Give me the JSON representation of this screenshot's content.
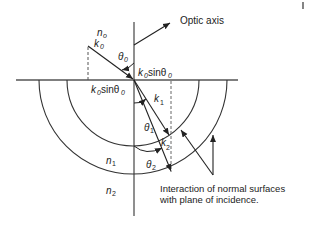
{
  "labels": {
    "optic_axis": "Optic axis",
    "n0": "n",
    "n0_sub": "o",
    "k0": "k",
    "k0_sub": "0",
    "theta0": "θ",
    "theta0_sub": "0",
    "k0sin_top": "k",
    "k0sin_top_sub": "0",
    "k0sin_top_rest": "sinθ",
    "k0sin_top_rest_sub": "0",
    "k0sin_left": "k",
    "k0sin_left_sub": "0",
    "k0sin_left_rest": "sinθ",
    "k0sin_left_rest_sub": "0",
    "k1": "k",
    "k1_sub": "1",
    "k2": "k",
    "k2_sub": "2",
    "theta1": "θ",
    "theta1_sub": "1",
    "theta2": "θ",
    "theta2_sub": "2",
    "n1": "n",
    "n1_sub": "1",
    "n2": "n",
    "n2_sub": "2",
    "caption_line1": "Interaction of normal surfaces",
    "caption_line2": "with plane of incidence."
  },
  "colors": {
    "line": "#333333",
    "dashed": "#555555"
  }
}
